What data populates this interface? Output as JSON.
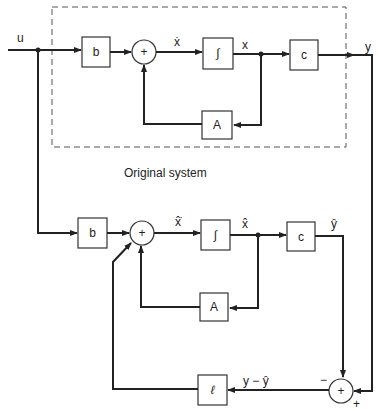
{
  "diagram": {
    "group_label": "Original system",
    "original_system": {
      "input_label": "u",
      "gain_b": "b",
      "sum_symbol": "+",
      "xdot_label": "ẋ",
      "integrator": "∫",
      "x_label": "x",
      "gain_c": "c",
      "output_label": "y",
      "feedback_A": "A"
    },
    "observer": {
      "gain_b": "b",
      "sum_symbol": "+",
      "xhatdot_label": "x̂̇",
      "integrator": "∫",
      "xhat_label": "x̂",
      "gain_c": "c",
      "yhat_label": "ŷ",
      "feedback_A": "A"
    },
    "error_path": {
      "sum_symbol": "+",
      "minus_sign": "−",
      "plus_sign": "+",
      "error_label": "y − ŷ",
      "gain_l": "ℓ"
    },
    "colors": {
      "line": "#222222",
      "box_border": "#333333",
      "dashed_border": "#555555",
      "background": "#ffffff"
    }
  }
}
